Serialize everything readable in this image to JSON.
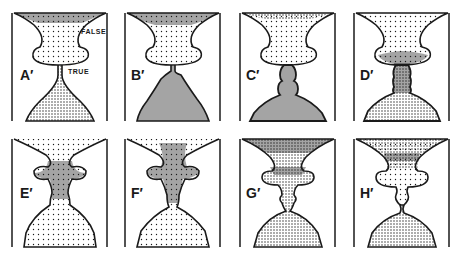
{
  "figure": {
    "colors": {
      "ink": "#1a1a1a",
      "paper": "#ffffff"
    },
    "annotations": {
      "false_label": "FALSE",
      "true_label": "TRUE"
    },
    "panels": [
      {
        "id": "A",
        "label": "A′",
        "state": "upper chamber lightly filled, lower dome filled, thin stem"
      },
      {
        "id": "B",
        "label": "B′",
        "state": "upper chamber filled, lower dome peaked toward stem"
      },
      {
        "id": "C",
        "label": "C′",
        "state": "lower dome with stacked beads rising toward neck"
      },
      {
        "id": "D",
        "label": "D′",
        "state": "dense column connects beads into upper chamber"
      },
      {
        "id": "E",
        "label": "E′",
        "state": "dense mass fills neck and lower part of upper chamber"
      },
      {
        "id": "F",
        "label": "F′",
        "state": "dense mass within upper chamber, narrow channel to dome"
      },
      {
        "id": "G",
        "label": "G′",
        "state": "upper chamber densely filled, droplet pinching off at neck"
      },
      {
        "id": "H",
        "label": "H′",
        "state": "upper chamber filled, pinch point separated from dome"
      }
    ]
  }
}
